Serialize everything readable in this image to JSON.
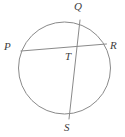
{
  "figure": {
    "background_color": "#ffffff",
    "stroke_color": "#8a8a8a",
    "label_color": "#3d3d3d",
    "stroke_width": 1,
    "width": 125,
    "height": 137
  },
  "circle": {
    "name": "circle-outline",
    "cx": 64.5,
    "cy": 68,
    "r": 46
  },
  "chords": [
    {
      "name": "chord-PR",
      "from_label": "P",
      "to_label": "R",
      "x1": 21,
      "y1": 51,
      "x2": 106.5,
      "y2": 44
    },
    {
      "name": "chord-QS",
      "from_label": "Q",
      "to_label": "S",
      "x1": 80,
      "y1": 20,
      "x2": 69,
      "y2": 119
    }
  ],
  "intersection": {
    "name": "point-T",
    "label": "T",
    "x": 74.3,
    "y": 49.3
  },
  "labels": {
    "Q": {
      "text": "Q",
      "x": 74,
      "y": 1
    },
    "P": {
      "text": "P",
      "x": 4,
      "y": 41
    },
    "R": {
      "text": "R",
      "x": 110,
      "y": 40
    },
    "T": {
      "text": "T",
      "x": 65,
      "y": 51
    },
    "S": {
      "text": "S",
      "x": 64,
      "y": 122
    }
  }
}
